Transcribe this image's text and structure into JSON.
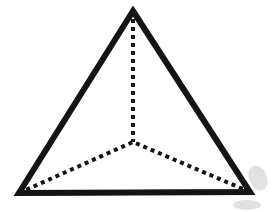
{
  "figure": {
    "background_color": "#ffffff",
    "stroke_color": "#141414",
    "smudge_color": "#c9c9c9"
  },
  "chart_data": {
    "type": "diagram",
    "shape": "tetrahedron",
    "canvas": {
      "width": 274,
      "height": 212
    },
    "vertices": [
      {
        "id": "apex",
        "label": "apex",
        "x": 133,
        "y": 11,
        "hidden": false
      },
      {
        "id": "front-left",
        "label": "front left base vertex",
        "x": 19,
        "y": 193,
        "hidden": false
      },
      {
        "id": "front-right",
        "label": "front right base vertex",
        "x": 250,
        "y": 192,
        "hidden": false
      },
      {
        "id": "back",
        "label": "rear base vertex",
        "x": 133,
        "y": 142,
        "hidden": true
      }
    ],
    "edges": [
      {
        "id": "apex-front-left",
        "from": "apex",
        "to": "front-left",
        "style": "solid",
        "width": 6
      },
      {
        "id": "apex-front-right",
        "from": "apex",
        "to": "front-right",
        "style": "solid",
        "width": 6
      },
      {
        "id": "base-front",
        "from": "front-left",
        "to": "front-right",
        "style": "solid",
        "width": 5
      },
      {
        "id": "apex-back",
        "from": "apex",
        "to": "back",
        "style": "dotted",
        "width": 4
      },
      {
        "id": "front-left-back",
        "from": "front-left",
        "to": "back",
        "style": "dotted",
        "width": 4
      },
      {
        "id": "front-right-back",
        "from": "front-right",
        "to": "back",
        "style": "dotted",
        "width": 4
      }
    ],
    "dot_pattern": "4 4",
    "visible_edge_count": 3,
    "hidden_edge_count": 3,
    "vertex_count": 4,
    "face_count": 4
  }
}
